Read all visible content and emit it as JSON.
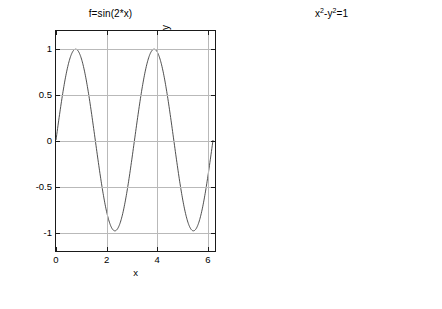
{
  "figure": {
    "width": 442,
    "height": 309,
    "background": "#ffffff",
    "grid_color": "#b9b9b9",
    "axis_color": "#1a1a1a",
    "curve_color": "#555555"
  },
  "panels": [
    {
      "id": "left",
      "title": "f=sin(2*x)",
      "xlabel": "x",
      "ylabel": "y",
      "xticks": [
        "0",
        "2",
        "4",
        "6"
      ],
      "yticks": [
        "1",
        "0.5",
        "0",
        "-0.5",
        "-1"
      ]
    },
    {
      "id": "right",
      "title_parts": {
        "a": "x",
        "sup1": "2",
        "b": "-y",
        "sup2": "2",
        "c": "=1"
      },
      "title": "x2-y2=1",
      "xlabel": "x",
      "ylabel": "y",
      "xticks": [
        "-5",
        "0",
        "5"
      ],
      "yticks": [
        "6",
        "4",
        "2",
        "0",
        "-2",
        "-4",
        "-6"
      ]
    }
  ],
  "chart_data": [
    {
      "type": "line",
      "id": "sine-plot",
      "title": "f=sin(2*x)",
      "xlabel": "x",
      "ylabel": "y",
      "xlim": [
        0,
        6.2832
      ],
      "ylim": [
        -1.2,
        1.2
      ],
      "xticks": [
        0,
        2,
        4,
        6
      ],
      "yticks": [
        1,
        0.5,
        0,
        -0.5,
        -1
      ],
      "grid": true,
      "legend": "none",
      "series": [
        {
          "name": "sin(2*x)",
          "expression": "y = sin(2*x)",
          "x": [
            0,
            0.1571,
            0.3142,
            0.4712,
            0.6283,
            0.7854,
            0.9425,
            1.0996,
            1.2566,
            1.4137,
            1.5708,
            1.7279,
            1.885,
            2.042,
            2.1991,
            2.3562,
            2.5133,
            2.6704,
            2.8274,
            2.9845,
            3.1416,
            3.2987,
            3.4558,
            3.6128,
            3.7699,
            3.927,
            4.0841,
            4.2412,
            4.3982,
            4.5553,
            4.7124,
            4.8695,
            5.0265,
            5.1836,
            5.3407,
            5.4978,
            5.6549,
            5.8119,
            5.969,
            6.1261,
            6.2832
          ],
          "y": [
            0,
            0.309,
            0.5878,
            0.809,
            0.9511,
            1,
            0.9511,
            0.809,
            0.5878,
            0.309,
            0,
            -0.309,
            -0.5878,
            -0.809,
            -0.9511,
            -1,
            -0.9511,
            -0.809,
            -0.5878,
            -0.309,
            0,
            0.309,
            0.5878,
            0.809,
            0.9511,
            1,
            0.9511,
            0.809,
            0.5878,
            0.309,
            0,
            -0.309,
            -0.5878,
            -0.809,
            -0.9511,
            -1,
            -0.9511,
            -0.809,
            -0.5878,
            -0.309,
            0
          ]
        }
      ]
    },
    {
      "type": "line",
      "id": "hyperbola-plot",
      "title": "x2-y2=1",
      "xlabel": "x",
      "ylabel": "y",
      "xlim": [
        -6.0828,
        6.0828
      ],
      "ylim": [
        -6,
        6
      ],
      "xticks": [
        -5,
        0,
        5
      ],
      "yticks": [
        6,
        4,
        2,
        0,
        -2,
        -4,
        -6
      ],
      "grid": true,
      "legend": "none",
      "series": [
        {
          "name": "right branch",
          "expression": "x = +sqrt(1+y^2)",
          "y": [
            -6,
            -5.5,
            -5,
            -4.5,
            -4,
            -3.5,
            -3,
            -2.5,
            -2,
            -1.5,
            -1,
            -0.75,
            -0.5,
            -0.25,
            0,
            0.25,
            0.5,
            0.75,
            1,
            1.5,
            2,
            2.5,
            3,
            3.5,
            4,
            4.5,
            5,
            5.5,
            6
          ],
          "x": [
            6.0828,
            5.5902,
            5.099,
            4.6098,
            4.1231,
            3.6401,
            3.1623,
            2.6926,
            2.2361,
            1.8028,
            1.4142,
            1.25,
            1.118,
            1.0308,
            1,
            1.0308,
            1.118,
            1.25,
            1.4142,
            1.8028,
            2.2361,
            2.6926,
            3.1623,
            3.6401,
            4.1231,
            4.6098,
            5.099,
            5.5902,
            6.0828
          ]
        },
        {
          "name": "left branch",
          "expression": "x = -sqrt(1+y^2)",
          "y": [
            -6,
            -5.5,
            -5,
            -4.5,
            -4,
            -3.5,
            -3,
            -2.5,
            -2,
            -1.5,
            -1,
            -0.75,
            -0.5,
            -0.25,
            0,
            0.25,
            0.5,
            0.75,
            1,
            1.5,
            2,
            2.5,
            3,
            3.5,
            4,
            4.5,
            5,
            5.5,
            6
          ],
          "x": [
            -6.0828,
            -5.5902,
            -5.099,
            -4.6098,
            -4.1231,
            -3.6401,
            -3.1623,
            -2.6926,
            -2.2361,
            -1.8028,
            -1.4142,
            -1.25,
            -1.118,
            -1.0308,
            -1,
            -1.0308,
            -1.118,
            -1.25,
            -1.4142,
            -1.8028,
            -2.2361,
            -2.6926,
            -3.1623,
            -3.6401,
            -4.1231,
            -4.6098,
            -5.099,
            -5.5902,
            -6.0828
          ]
        }
      ]
    }
  ]
}
